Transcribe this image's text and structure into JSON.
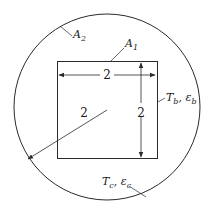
{
  "diagram": {
    "labels": {
      "outer_surface": "A",
      "outer_surface_sub": "2",
      "inner_surface": "A",
      "inner_surface_sub": "1",
      "square_width": "2",
      "square_height": "2",
      "circle_radius": "2",
      "inner_props_T": "T",
      "inner_props_T_sub": "b",
      "inner_props_sep": ", ",
      "inner_props_eps": "ε",
      "inner_props_eps_sub": "b",
      "outer_props_T": "T",
      "outer_props_T_sub": "c",
      "outer_props_sep": ", ",
      "outer_props_eps": "ε",
      "outer_props_eps_sub": "c"
    },
    "colors": {
      "stroke": "#2a2a2a",
      "background": "#ffffff"
    }
  }
}
